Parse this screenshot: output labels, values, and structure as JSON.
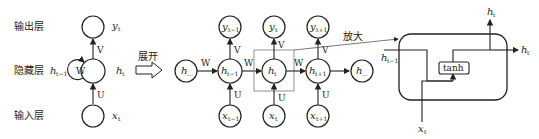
{
  "labels": {
    "output_layer": "输出层",
    "hidden_layer": "隐藏层",
    "input_layer": "输入层",
    "unfold": "展开",
    "zoom": "放大"
  },
  "folded": {
    "y": "y",
    "y_sub": "t",
    "h": "h",
    "h_sub": "t",
    "h_prev": "h",
    "h_prev_sub": "t−1",
    "x": "x",
    "x_sub": "t",
    "W": "W",
    "V": "V",
    "U": "U"
  },
  "unrolled": {
    "h_left": "h",
    "h_left_sub": "…",
    "h_right": "h",
    "h_right_sub": "…",
    "steps": [
      {
        "h": "h",
        "h_sub": "t−1",
        "x": "x",
        "x_sub": "t−1",
        "y": "y",
        "y_sub": "t−1"
      },
      {
        "h": "h",
        "h_sub": "t",
        "x": "x",
        "x_sub": "t",
        "y": "y",
        "y_sub": "t"
      },
      {
        "h": "h",
        "h_sub": "t+1",
        "x": "x",
        "x_sub": "t+1",
        "y": "y",
        "y_sub": "t+1"
      }
    ],
    "W": "W",
    "V": "V",
    "U": "U"
  },
  "cell": {
    "activation": "tanh",
    "h_in": "h",
    "h_in_sub": "t−1",
    "x_in": "x",
    "x_in_sub": "t",
    "h_out_top": "h",
    "h_out_top_sub": "t",
    "h_out_right": "h",
    "h_out_right_sub": "t"
  }
}
